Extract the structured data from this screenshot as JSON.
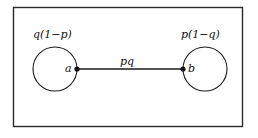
{
  "figure": {
    "background_color": "#ffffff",
    "stroke_color": "#1a1a1a",
    "frame": {
      "name": "outer-frame",
      "x": 13,
      "y": 7,
      "width": 230,
      "height": 120
    },
    "nodes": [
      {
        "id": "a",
        "vertex_label": "a",
        "weight_label": "q(1−p)",
        "cx": 55,
        "cy": 69,
        "r": 22,
        "port_side": "right"
      },
      {
        "id": "b",
        "vertex_label": "b",
        "weight_label": "p(1−q)",
        "cx": 205,
        "cy": 69,
        "r": 22,
        "port_side": "left"
      }
    ],
    "edge": {
      "label": "pq",
      "from": "a",
      "to": "b",
      "x1": 77,
      "x2": 183,
      "y": 69
    }
  }
}
